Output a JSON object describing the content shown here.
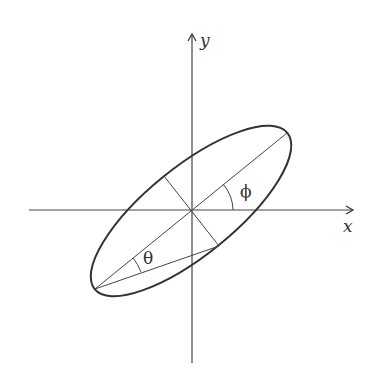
{
  "diagram": {
    "type": "rotated-ellipse",
    "axes": {
      "x_label": "x",
      "y_label": "y"
    },
    "angles": {
      "major_axis_angle": "ϕ",
      "chord_angle": "θ"
    },
    "colors": {
      "stroke": "#333333",
      "background": "#ffffff"
    }
  }
}
